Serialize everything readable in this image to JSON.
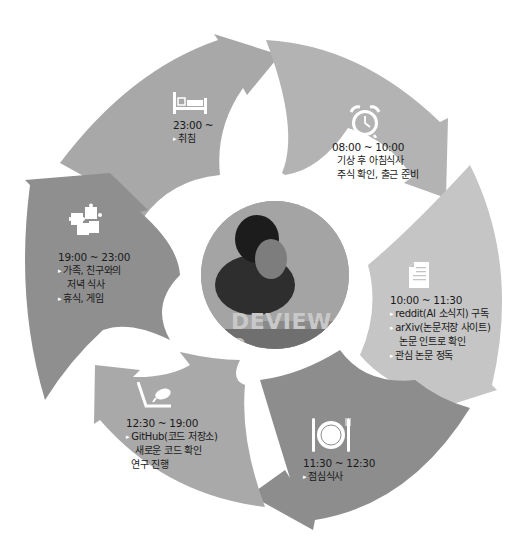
{
  "center": {
    "image_label": "presenter-photo",
    "banner_text": "DEVIEW 2"
  },
  "colors": {
    "background": "#ffffff",
    "segment_sleep": "#a8a8a8",
    "segment_morning": "#b3b3b3",
    "segment_research_reading": "#c5c5c5",
    "segment_lunch": "#8d8d8d",
    "segment_research": "#a9a9a9",
    "segment_evening": "#8f8f8f",
    "text": "#1a1a1a",
    "icon": "#ffffff"
  },
  "segments": [
    {
      "id": "sleep",
      "icon": "bed-icon",
      "time": "23:00 ~",
      "items": [
        {
          "text": "취침"
        }
      ]
    },
    {
      "id": "morning",
      "icon": "alarm-clock-icon",
      "time": "08:00 ~ 10:00",
      "items": [
        {
          "text": "기상 후 아침식사"
        },
        {
          "text": "주식 확인, 출근 준비"
        }
      ]
    },
    {
      "id": "reading",
      "icon": "document-icon",
      "time": "10:00 ~ 11:30",
      "items": [
        {
          "text": "reddit(AI 소식지) 구독"
        },
        {
          "text": "arXiv(논문저장 사이트)",
          "cont": "논문 인트로 확인"
        },
        {
          "text": "관심 논문 정독"
        }
      ]
    },
    {
      "id": "lunch",
      "icon": "plate-cutlery-icon",
      "time": "11:30 ~ 12:30",
      "items": [
        {
          "text": "점심식사"
        }
      ]
    },
    {
      "id": "research",
      "icon": "laptop-hand-icon",
      "time": "12:30 ~ 19:00",
      "items": [
        {
          "text": "GitHub(코드 저장소)",
          "cont": "새로운 코드 확인"
        },
        {
          "text": "연구 진행"
        }
      ]
    },
    {
      "id": "evening",
      "icon": "puzzle-icon",
      "time": "19:00 ~ 23:00",
      "items": [
        {
          "text": "가족, 친구와의",
          "cont": "저녁 식사"
        },
        {
          "text": "휴식, 게임"
        }
      ]
    }
  ]
}
